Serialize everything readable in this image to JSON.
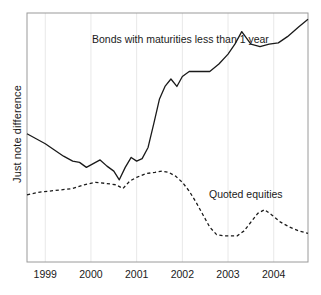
{
  "axes": {
    "ylabel": "Just note difference",
    "xticklabels": [
      "1999",
      "2000",
      "2001",
      "2002",
      "2003",
      "2004"
    ]
  },
  "annotations": {
    "bonds": "Bonds with maturities less than 1 year",
    "equities": "Quoted equities"
  },
  "colors": {
    "line": "#1a1a1a",
    "grid": "#e8e8e8",
    "frame": "#9a9a9a",
    "background": "#ffffff"
  },
  "chart_data": {
    "type": "line",
    "title": "",
    "xlabel": "",
    "ylabel": "Just note difference",
    "xlim": [
      1998.6,
      2004.75
    ],
    "ylim": [
      0,
      100
    ],
    "grid": true,
    "grid_axis": "x",
    "legend": "inline-annotations",
    "xticks": [
      1999,
      2000,
      2001,
      2002,
      2003,
      2004
    ],
    "xticklabels": [
      "1999",
      "2000",
      "2001",
      "2002",
      "2003",
      "2004"
    ],
    "yticklabels": [],
    "series": [
      {
        "name": "Bonds with maturities less than 1 year",
        "style": "solid",
        "x": [
          1998.6,
          1998.8,
          1999.0,
          1999.2,
          1999.4,
          1999.6,
          1999.75,
          1999.9,
          2000.05,
          2000.2,
          2000.35,
          2000.5,
          2000.62,
          2000.75,
          2000.88,
          2001.0,
          2001.12,
          2001.25,
          2001.38,
          2001.5,
          2001.62,
          2001.75,
          2001.88,
          2002.0,
          2002.15,
          2002.3,
          2002.45,
          2002.6,
          2002.8,
          2003.0,
          2003.15,
          2003.3,
          2003.5,
          2003.7,
          2003.9,
          2004.1,
          2004.3,
          2004.55,
          2004.75
        ],
        "values": [
          51.5,
          49.5,
          47.5,
          45.0,
          42.5,
          40.5,
          40.0,
          38.0,
          39.5,
          41.0,
          38.5,
          36.5,
          33.0,
          38.0,
          42.0,
          40.5,
          41.5,
          46.0,
          56.0,
          65.5,
          70.5,
          73.5,
          70.5,
          74.5,
          76.5,
          76.5,
          76.5,
          76.5,
          79.5,
          83.5,
          87.5,
          92.5,
          87.5,
          86.5,
          87.5,
          88.0,
          90.5,
          94.5,
          97.5
        ]
      },
      {
        "name": "Quoted equities",
        "style": "dashed",
        "x": [
          1998.6,
          1998.85,
          1999.1,
          1999.35,
          1999.6,
          1999.85,
          2000.1,
          2000.35,
          2000.55,
          2000.7,
          2000.85,
          2001.0,
          2001.2,
          2001.4,
          2001.55,
          2001.7,
          2001.85,
          2002.0,
          2002.15,
          2002.3,
          2002.45,
          2002.6,
          2002.75,
          2002.9,
          2003.05,
          2003.2,
          2003.35,
          2003.5,
          2003.65,
          2003.8,
          2003.95,
          2004.15,
          2004.35,
          2004.55,
          2004.75
        ],
        "values": [
          27.0,
          28.0,
          28.5,
          29.0,
          29.5,
          31.0,
          32.0,
          31.5,
          31.0,
          29.5,
          32.5,
          34.0,
          35.5,
          36.0,
          36.5,
          36.0,
          34.5,
          32.0,
          28.5,
          24.0,
          19.0,
          14.0,
          11.0,
          10.5,
          10.5,
          10.5,
          12.5,
          16.0,
          19.5,
          21.0,
          19.0,
          16.0,
          14.0,
          12.5,
          11.5
        ]
      }
    ]
  }
}
